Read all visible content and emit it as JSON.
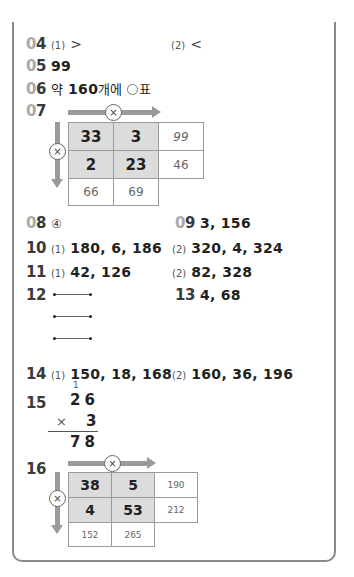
{
  "problems": {
    "p04": {
      "pre": "0",
      "dg": "4",
      "part1_label": "(1)",
      "part1_answer": ">",
      "part2_label": "(2)",
      "part2_answer": "<"
    },
    "p05": {
      "pre": "0",
      "dg": "5",
      "answer": "99"
    },
    "p06": {
      "pre": "0",
      "dg": "6",
      "answer_prefix": "약",
      "answer_number": "160",
      "answer_suffix": "개에",
      "answer_mark": "표",
      "mark_icon": "circle-icon"
    },
    "p07": {
      "pre": "0",
      "dg": "7",
      "operator": "×",
      "grid": [
        [
          "33",
          "3",
          "99"
        ],
        [
          "2",
          "23",
          "46"
        ],
        [
          "66",
          "69",
          ""
        ]
      ]
    },
    "p08": {
      "pre": "0",
      "dg": "8",
      "answer": "④"
    },
    "p09": {
      "pre": "0",
      "dg": "9",
      "answer": "3, 156"
    },
    "p10": {
      "label": "10",
      "part1_label": "(1)",
      "part1_answer": "180, 6, 186",
      "part2_label": "(2)",
      "part2_answer": "320, 4, 324"
    },
    "p11": {
      "label": "11",
      "part1_label": "(1)",
      "part1_answer": "42, 126",
      "part2_label": "(2)",
      "part2_answer": "82, 328"
    },
    "p12": {
      "label": "12",
      "segments": 3
    },
    "p13": {
      "label": "13",
      "answer": "4, 68"
    },
    "p14": {
      "label": "14",
      "part1_label": "(1)",
      "part1_answer": "150, 18, 168",
      "part2_label": "(2)",
      "part2_answer": "160, 36, 196"
    },
    "p15": {
      "label": "15",
      "carry": "1",
      "multiplicand": "26",
      "operator": "×",
      "multiplier": "3",
      "product": "78"
    },
    "p16": {
      "label": "16",
      "operator": "×",
      "grid": [
        [
          "38",
          "5",
          "190"
        ],
        [
          "4",
          "53",
          "212"
        ],
        [
          "152",
          "265",
          ""
        ]
      ]
    }
  },
  "colors": {
    "frame": "#8a8a8a",
    "number_prefix": "#a9a9a9",
    "given_cell": "#dcdcdc",
    "arrow": "#9a9a9a"
  }
}
